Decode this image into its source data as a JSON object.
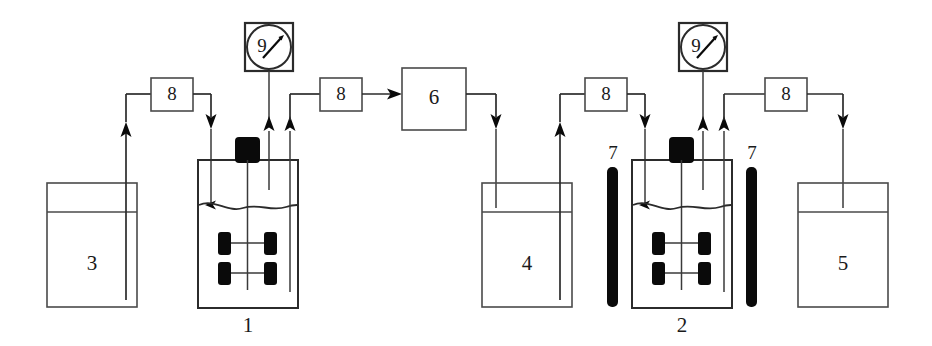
{
  "diagram": {
    "background_color": "#ffffff",
    "line_color": "#2b2b2b",
    "fill_color": "#0a0a0a",
    "width": 932,
    "height": 346
  },
  "equipment": {
    "reactor_1": {
      "label": "1",
      "kind": "stirred-tank-reactor"
    },
    "reactor_2": {
      "label": "2",
      "kind": "stirred-tank-reactor"
    },
    "tank_3": {
      "label": "3",
      "kind": "feed-tank"
    },
    "tank_4": {
      "label": "4",
      "kind": "intermediate-tank"
    },
    "tank_5": {
      "label": "5",
      "kind": "product-tank"
    },
    "unit_6": {
      "label": "6",
      "kind": "process-unit"
    },
    "lamp_7_left": {
      "label": "7",
      "kind": "uv-lamp"
    },
    "lamp_7_right": {
      "label": "7",
      "kind": "uv-lamp"
    },
    "pump_8_a": {
      "label": "8",
      "kind": "pump"
    },
    "pump_8_b": {
      "label": "8",
      "kind": "pump"
    },
    "pump_8_c": {
      "label": "8",
      "kind": "pump"
    },
    "pump_8_d": {
      "label": "8",
      "kind": "pump"
    },
    "gauge_9_left": {
      "label": "9",
      "kind": "pressure-gauge"
    },
    "gauge_9_right": {
      "label": "9",
      "kind": "pressure-gauge"
    }
  },
  "icons": {
    "gauge": "gauge-icon",
    "pump": "pump-icon",
    "stirrer": "stirrer-motor-icon",
    "impeller": "impeller-icon",
    "lamp": "lamp-icon",
    "arrow": "flow-arrow-icon",
    "liquid_level": "liquid-level-icon"
  }
}
